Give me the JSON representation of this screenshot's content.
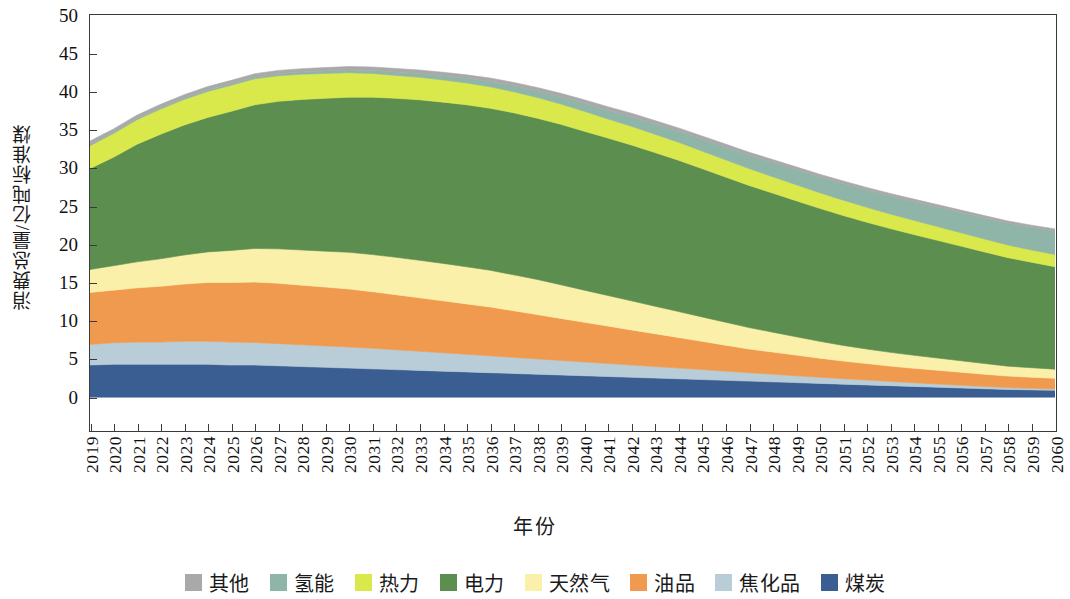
{
  "chart_data": {
    "type": "area",
    "title": "",
    "xlabel": "年份",
    "ylabel": "消费总量/亿吨标准煤",
    "stacked": true,
    "grid": false,
    "legend_position": "bottom",
    "ylim": [
      -4.3,
      50
    ],
    "y_ticks": [
      0,
      5,
      10,
      15,
      20,
      25,
      30,
      35,
      40,
      45,
      50
    ],
    "xlim": [
      "2019",
      "2060"
    ],
    "categories": [
      "2019",
      "2020",
      "2021",
      "2022",
      "2023",
      "2024",
      "2025",
      "2026",
      "2027",
      "2028",
      "2029",
      "2030",
      "2031",
      "2032",
      "2033",
      "2034",
      "2035",
      "2036",
      "2037",
      "2038",
      "2039",
      "2040",
      "2041",
      "2042",
      "2043",
      "2044",
      "2045",
      "2046",
      "2047",
      "2048",
      "2049",
      "2050",
      "2051",
      "2052",
      "2053",
      "2054",
      "2055",
      "2056",
      "2057",
      "2058",
      "2059",
      "2060"
    ],
    "series": [
      {
        "name": "煤炭",
        "color": "#3a5e92",
        "values": [
          4.2,
          4.3,
          4.3,
          4.3,
          4.3,
          4.3,
          4.2,
          4.2,
          4.1,
          4.0,
          3.9,
          3.8,
          3.7,
          3.6,
          3.5,
          3.4,
          3.3,
          3.2,
          3.1,
          3.0,
          2.9,
          2.8,
          2.7,
          2.6,
          2.5,
          2.4,
          2.3,
          2.2,
          2.1,
          2.0,
          1.9,
          1.8,
          1.7,
          1.6,
          1.5,
          1.4,
          1.3,
          1.2,
          1.1,
          1.0,
          0.95,
          0.9
        ]
      },
      {
        "name": "焦化品",
        "color": "#b8cdd8",
        "values": [
          2.7,
          2.8,
          2.9,
          2.9,
          3.0,
          3.0,
          3.0,
          2.95,
          2.9,
          2.85,
          2.8,
          2.75,
          2.7,
          2.6,
          2.5,
          2.4,
          2.3,
          2.2,
          2.1,
          2.0,
          1.9,
          1.8,
          1.7,
          1.6,
          1.5,
          1.4,
          1.3,
          1.2,
          1.1,
          1.0,
          0.9,
          0.8,
          0.72,
          0.64,
          0.56,
          0.48,
          0.42,
          0.36,
          0.3,
          0.25,
          0.2,
          0.16
        ]
      },
      {
        "name": "油品",
        "color": "#ef9a4e",
        "values": [
          6.8,
          6.9,
          7.1,
          7.3,
          7.5,
          7.7,
          7.8,
          7.9,
          7.9,
          7.8,
          7.7,
          7.6,
          7.4,
          7.2,
          7.0,
          6.8,
          6.6,
          6.4,
          6.1,
          5.8,
          5.5,
          5.2,
          4.9,
          4.6,
          4.3,
          4.0,
          3.7,
          3.4,
          3.1,
          2.9,
          2.7,
          2.5,
          2.3,
          2.15,
          2.0,
          1.9,
          1.8,
          1.7,
          1.6,
          1.5,
          1.45,
          1.4
        ]
      },
      {
        "name": "天然气",
        "color": "#fbf0a9",
        "values": [
          3.0,
          3.2,
          3.4,
          3.6,
          3.8,
          4.0,
          4.2,
          4.4,
          4.5,
          4.6,
          4.7,
          4.8,
          4.85,
          4.9,
          4.9,
          4.9,
          4.85,
          4.8,
          4.7,
          4.6,
          4.4,
          4.2,
          4.0,
          3.8,
          3.6,
          3.4,
          3.2,
          3.0,
          2.8,
          2.6,
          2.4,
          2.2,
          2.05,
          1.9,
          1.8,
          1.7,
          1.6,
          1.5,
          1.4,
          1.3,
          1.25,
          1.2
        ]
      },
      {
        "name": "电力",
        "color": "#5c8f4f",
        "values": [
          13.2,
          14.2,
          15.4,
          16.3,
          17.0,
          17.6,
          18.2,
          18.8,
          19.3,
          19.7,
          20.0,
          20.3,
          20.6,
          20.8,
          21.0,
          21.1,
          21.2,
          21.2,
          21.2,
          21.1,
          21.0,
          20.8,
          20.6,
          20.4,
          20.1,
          19.8,
          19.4,
          19.0,
          18.6,
          18.2,
          17.8,
          17.4,
          17.0,
          16.6,
          16.2,
          15.8,
          15.4,
          15.0,
          14.6,
          14.2,
          13.8,
          13.4
        ]
      },
      {
        "name": "热力",
        "color": "#d9e84a",
        "values": [
          3.0,
          3.1,
          3.2,
          3.3,
          3.35,
          3.4,
          3.4,
          3.4,
          3.35,
          3.3,
          3.25,
          3.2,
          3.1,
          3.0,
          2.95,
          2.9,
          2.85,
          2.8,
          2.75,
          2.7,
          2.65,
          2.6,
          2.5,
          2.45,
          2.4,
          2.35,
          2.3,
          2.25,
          2.2,
          2.15,
          2.1,
          2.05,
          2.0,
          1.95,
          1.9,
          1.85,
          1.8,
          1.75,
          1.7,
          1.65,
          1.6,
          1.6
        ]
      },
      {
        "name": "氢能",
        "color": "#8fb4a8",
        "values": [
          0.15,
          0.15,
          0.15,
          0.16,
          0.17,
          0.18,
          0.2,
          0.22,
          0.25,
          0.28,
          0.32,
          0.36,
          0.4,
          0.45,
          0.5,
          0.56,
          0.62,
          0.7,
          0.78,
          0.86,
          0.95,
          1.05,
          1.15,
          1.25,
          1.35,
          1.45,
          1.55,
          1.65,
          1.75,
          1.85,
          1.95,
          2.05,
          2.15,
          2.25,
          2.35,
          2.45,
          2.55,
          2.65,
          2.75,
          2.85,
          2.95,
          3.05
        ]
      },
      {
        "name": "其他",
        "color": "#a9a9a9",
        "values": [
          0.45,
          0.45,
          0.45,
          0.45,
          0.45,
          0.45,
          0.45,
          0.45,
          0.45,
          0.45,
          0.45,
          0.45,
          0.45,
          0.45,
          0.45,
          0.45,
          0.45,
          0.45,
          0.45,
          0.45,
          0.45,
          0.45,
          0.45,
          0.45,
          0.44,
          0.43,
          0.42,
          0.41,
          0.4,
          0.39,
          0.38,
          0.37,
          0.36,
          0.35,
          0.34,
          0.33,
          0.32,
          0.31,
          0.3,
          0.3,
          0.3,
          0.3
        ]
      }
    ],
    "legend": [
      {
        "label": "其他",
        "color": "#a9a9a9"
      },
      {
        "label": "氢能",
        "color": "#8fb4a8"
      },
      {
        "label": "热力",
        "color": "#d9e84a"
      },
      {
        "label": "电力",
        "color": "#5c8f4f"
      },
      {
        "label": "天然气",
        "color": "#fbf0a9"
      },
      {
        "label": "油品",
        "color": "#ef9a4e"
      },
      {
        "label": "焦化品",
        "color": "#b8cdd8"
      },
      {
        "label": "煤炭",
        "color": "#3a5e92"
      }
    ]
  }
}
